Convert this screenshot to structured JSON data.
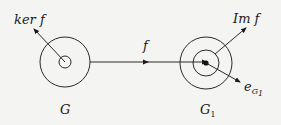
{
  "diagram": {
    "left_group": {
      "label": "G",
      "inner_label": "ker f"
    },
    "right_group": {
      "label": "G",
      "label_subscript": "1",
      "image_label": "Im f",
      "identity_label": "e",
      "identity_subscript": "G",
      "identity_subscript2": "1"
    },
    "map_label": "f",
    "colors": {
      "background": "#f4f4f2",
      "stroke": "#2a2a2a"
    }
  }
}
